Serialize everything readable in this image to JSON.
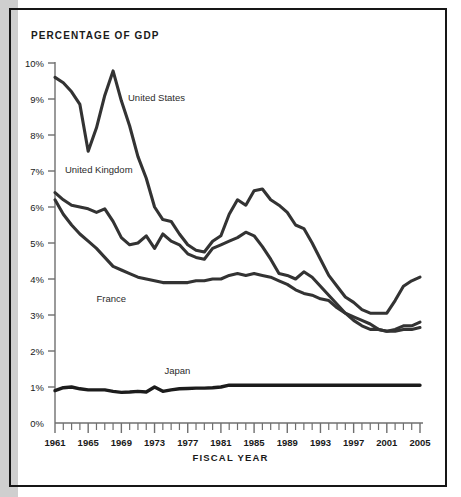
{
  "figure": {
    "title": "PERCENTAGE OF GDP",
    "xaxis_title": "FISCAL YEAR"
  },
  "chart_data": {
    "type": "line",
    "title": "PERCENTAGE OF GDP",
    "xlabel": "FISCAL YEAR",
    "ylabel": "PERCENTAGE OF GDP",
    "xlim": [
      1961,
      2005
    ],
    "ylim": [
      0,
      10
    ],
    "grid": false,
    "legend": "inline-labels",
    "ytick_labels": [
      "0%",
      "1%",
      "2%",
      "3%",
      "4%",
      "5%",
      "6%",
      "7%",
      "8%",
      "9%",
      "10%"
    ],
    "ytick_values": [
      0,
      1,
      2,
      3,
      4,
      5,
      6,
      7,
      8,
      9,
      10
    ],
    "xtick_labels": [
      "1961",
      "1965",
      "1969",
      "1973",
      "1977",
      "1981",
      "1985",
      "1989",
      "1993",
      "1997",
      "2001",
      "2005"
    ],
    "xtick_values": [
      1961,
      1965,
      1969,
      1973,
      1977,
      1981,
      1985,
      1989,
      1993,
      1997,
      2001,
      2005
    ],
    "xtick_minor_step": 1,
    "x": [
      1961,
      1962,
      1963,
      1964,
      1965,
      1966,
      1967,
      1968,
      1969,
      1970,
      1971,
      1972,
      1973,
      1974,
      1975,
      1976,
      1977,
      1978,
      1979,
      1980,
      1981,
      1982,
      1983,
      1984,
      1985,
      1986,
      1987,
      1988,
      1989,
      1990,
      1991,
      1992,
      1993,
      1994,
      1995,
      1996,
      1997,
      1998,
      1999,
      2000,
      2001,
      2002,
      2003,
      2004,
      2005
    ],
    "series": [
      {
        "name": "United States",
        "color": "#333333",
        "label_x": 1969.8,
        "label_y": 8.95,
        "values": [
          9.6,
          9.45,
          9.2,
          8.85,
          7.55,
          8.2,
          9.1,
          9.78,
          8.95,
          8.25,
          7.4,
          6.8,
          6.0,
          5.65,
          5.6,
          5.25,
          4.95,
          4.8,
          4.75,
          5.05,
          5.2,
          5.8,
          6.2,
          6.05,
          6.45,
          6.5,
          6.2,
          6.05,
          5.85,
          5.5,
          5.4,
          5.0,
          4.55,
          4.1,
          3.8,
          3.5,
          3.35,
          3.15,
          3.05,
          3.05,
          3.05,
          3.4,
          3.8,
          3.95,
          4.05
        ]
      },
      {
        "name": "United Kingdom",
        "color": "#333333",
        "label_x": 1962.2,
        "label_y": 6.95,
        "values": [
          6.4,
          6.2,
          6.05,
          6.0,
          5.95,
          5.85,
          5.95,
          5.6,
          5.15,
          4.95,
          5.0,
          5.2,
          4.85,
          5.25,
          5.05,
          4.95,
          4.7,
          4.6,
          4.55,
          4.85,
          4.95,
          5.05,
          5.15,
          5.3,
          5.2,
          4.9,
          4.55,
          4.15,
          4.1,
          4.0,
          4.2,
          4.05,
          3.8,
          3.55,
          3.3,
          3.05,
          2.85,
          2.7,
          2.6,
          2.6,
          2.55,
          2.6,
          2.7,
          2.7,
          2.8
        ]
      },
      {
        "name": "France",
        "color": "#333333",
        "label_x": 1966.0,
        "label_y": 3.35,
        "values": [
          6.2,
          5.8,
          5.5,
          5.25,
          5.05,
          4.85,
          4.6,
          4.35,
          4.25,
          4.15,
          4.05,
          4.0,
          3.95,
          3.9,
          3.9,
          3.9,
          3.9,
          3.95,
          3.95,
          4.0,
          4.0,
          4.1,
          4.15,
          4.1,
          4.15,
          4.1,
          4.05,
          3.95,
          3.85,
          3.7,
          3.6,
          3.55,
          3.45,
          3.4,
          3.2,
          3.05,
          2.95,
          2.85,
          2.75,
          2.6,
          2.55,
          2.55,
          2.6,
          2.6,
          2.65
        ]
      },
      {
        "name": "Japan",
        "color": "#1c1c1c",
        "label_x": 1974.2,
        "label_y": 1.35,
        "values": [
          0.9,
          0.98,
          1.0,
          0.95,
          0.92,
          0.92,
          0.92,
          0.88,
          0.85,
          0.86,
          0.88,
          0.86,
          1.0,
          0.88,
          0.92,
          0.95,
          0.96,
          0.97,
          0.97,
          0.98,
          1.0,
          1.05,
          1.05,
          1.05,
          1.05,
          1.05,
          1.05,
          1.05,
          1.05,
          1.05,
          1.05,
          1.05,
          1.05,
          1.05,
          1.05,
          1.05,
          1.05,
          1.05,
          1.05,
          1.05,
          1.05,
          1.05,
          1.05,
          1.05,
          1.05
        ]
      }
    ]
  }
}
